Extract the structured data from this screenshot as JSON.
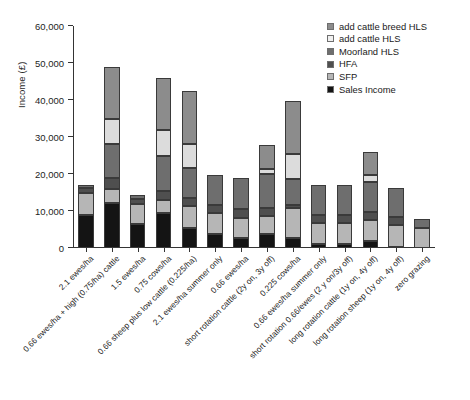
{
  "chart_data": {
    "type": "bar",
    "subtype": "stacked-vertical",
    "title": "",
    "xlabel": "",
    "ylabel": "Income (£)",
    "ylim": [
      0,
      60000
    ],
    "ytick_values": [
      0,
      10000,
      20000,
      30000,
      40000,
      50000,
      60000
    ],
    "ytick_labels": [
      "0",
      "10,000",
      "20,000",
      "30,000",
      "40,000",
      "50,000",
      "60,000"
    ],
    "grid": false,
    "legend_position": "top-right",
    "categories": [
      "2.1 ewes/ha",
      "0.66 ewes/ha + high (0.75/ha) cattle",
      "1.5 ewes/ha",
      "0.75 cows/ha",
      "0.66 sheep plus low cattle (0.225/ha)",
      "2.1 ewes/ha summer only",
      "0.66 ewes/ha",
      "short rotation cattle (2y on, 3y off)",
      "0.225 cows/ha",
      "0.66 ewes/ha summer only",
      "short rotation 0.66/ewes (2 y on/3y off)",
      "long rotation cattle (1y on, 4y off)",
      "long rotation sheep (1y on, 4y off)",
      "zero grazing"
    ],
    "series": [
      {
        "name": "Sales Income",
        "color": "#141414",
        "values": [
          9000,
          12100,
          6400,
          9500,
          5500,
          3800,
          2800,
          3900,
          2700,
          1100,
          1200,
          1900,
          400,
          0
        ]
      },
      {
        "name": "SFP",
        "color": "#b6b6b6",
        "values": [
          5900,
          3900,
          5600,
          3400,
          5900,
          5700,
          5300,
          4700,
          8000,
          5600,
          5600,
          5600,
          5800,
          5500
        ]
      },
      {
        "name": "HFA",
        "color": "#4f4f4f",
        "values": [
          1300,
          3000,
          1200,
          2500,
          2200,
          2000,
          2400,
          2200,
          1000,
          2100,
          2100,
          2200,
          2100,
          0
        ]
      },
      {
        "name": "Moorland HLS",
        "color": "#6e6e6e",
        "values": [
          800,
          9000,
          1100,
          9500,
          8000,
          8200,
          8300,
          9300,
          7000,
          8200,
          8200,
          8100,
          8000,
          2300
        ]
      },
      {
        "name": "add cattle HLS",
        "color": "#dcdcdc",
        "values": [
          0,
          7000,
          0,
          7000,
          6400,
          0,
          0,
          1200,
          6800,
          0,
          0,
          2000,
          0,
          0
        ]
      },
      {
        "name": "add cattle breed HLS",
        "color": "#8c8c8c",
        "values": [
          0,
          14000,
          0,
          14000,
          14500,
          0,
          0,
          6500,
          14300,
          0,
          0,
          6200,
          0,
          0
        ]
      }
    ],
    "totals": [
      17000,
      49000,
      14300,
      45900,
      42500,
      19700,
      18800,
      27800,
      39800,
      17000,
      17100,
      26000,
      16300,
      7800
    ]
  },
  "legend": {
    "entries": [
      {
        "label": "add cattle breed HLS",
        "color": "#8c8c8c"
      },
      {
        "label": "add cattle HLS",
        "color": "#f0f0f0"
      },
      {
        "label": "Moorland HLS",
        "color": "#6e6e6e"
      },
      {
        "label": "HFA",
        "color": "#4f4f4f"
      },
      {
        "label": "SFP",
        "color": "#b6b6b6"
      },
      {
        "label": "Sales Income",
        "color": "#141414"
      }
    ]
  }
}
